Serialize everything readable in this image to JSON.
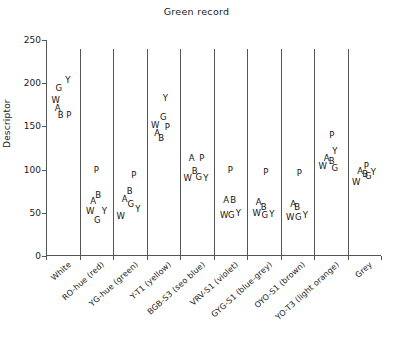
{
  "chart_data": {
    "type": "scatter",
    "title": "Green record",
    "xlabel": "",
    "ylabel": "Descriptor",
    "ylim": [
      0,
      250
    ],
    "yticks": [
      0,
      50,
      100,
      150,
      200,
      250
    ],
    "grid": false,
    "legend": "none",
    "point_label_note": "Each plotted point is drawn as the letter code of its observer",
    "observer_codes": [
      "W",
      "A",
      "B",
      "G",
      "P",
      "Y"
    ],
    "categories": [
      "White",
      "RO-hue (red)",
      "YG-hue (green)",
      "Y-T1 (yellow)",
      "BGB-S3 (seo blue)",
      "VRV-S1 (violet)",
      "GYG-S1 (blue-grey)",
      "OYO-S1 (brown)",
      "YO-T3 (light orange)",
      "Grey"
    ],
    "series": [
      {
        "name": "W",
        "values": [
          180,
          52,
          48,
          152,
          92,
          50,
          52,
          48,
          106,
          88
        ]
      },
      {
        "name": "A",
        "values": [
          173,
          64,
          66,
          143,
          113,
          62,
          60,
          58,
          112,
          97
        ]
      },
      {
        "name": "B",
        "values": [
          163,
          68,
          72,
          137,
          97,
          62,
          57,
          56,
          110,
          95
        ]
      },
      {
        "name": "G",
        "values": [
          195,
          45,
          62,
          161,
          93,
          50,
          50,
          48,
          104,
          94
        ]
      },
      {
        "name": "P",
        "values": [
          163,
          100,
          94,
          150,
          113,
          100,
          97,
          96,
          140,
          104
        ]
      },
      {
        "name": "Y",
        "values": [
          201,
          52,
          56,
          183,
          91,
          51,
          50,
          50,
          121,
          96
        ]
      }
    ],
    "points": [
      {
        "category_index": 0,
        "label": "G",
        "value": 195
      },
      {
        "category_index": 0,
        "label": "Y",
        "value": 201
      },
      {
        "category_index": 0,
        "label": "W",
        "value": 180
      },
      {
        "category_index": 0,
        "label": "A",
        "value": 173
      },
      {
        "category_index": 0,
        "label": "B",
        "value": 163
      },
      {
        "category_index": 0,
        "label": "P",
        "value": 163
      },
      {
        "category_index": 1,
        "label": "P",
        "value": 100
      },
      {
        "category_index": 1,
        "label": "A",
        "value": 64
      },
      {
        "category_index": 1,
        "label": "B",
        "value": 68
      },
      {
        "category_index": 1,
        "label": "W",
        "value": 52
      },
      {
        "category_index": 1,
        "label": "G",
        "value": 45
      },
      {
        "category_index": 1,
        "label": "Y",
        "value": 52
      },
      {
        "category_index": 2,
        "label": "P",
        "value": 94
      },
      {
        "category_index": 2,
        "label": "A",
        "value": 66
      },
      {
        "category_index": 2,
        "label": "B",
        "value": 72
      },
      {
        "category_index": 2,
        "label": "G",
        "value": 62
      },
      {
        "category_index": 2,
        "label": "Y",
        "value": 56
      },
      {
        "category_index": 2,
        "label": "W",
        "value": 48
      },
      {
        "category_index": 3,
        "label": "Y",
        "value": 183
      },
      {
        "category_index": 3,
        "label": "G",
        "value": 161
      },
      {
        "category_index": 3,
        "label": "W",
        "value": 152
      },
      {
        "category_index": 3,
        "label": "P",
        "value": 150
      },
      {
        "category_index": 3,
        "label": "A",
        "value": 143
      },
      {
        "category_index": 3,
        "label": "B",
        "value": 137
      },
      {
        "category_index": 4,
        "label": "A",
        "value": 113
      },
      {
        "category_index": 4,
        "label": "P",
        "value": 113
      },
      {
        "category_index": 4,
        "label": "W",
        "value": 92
      },
      {
        "category_index": 4,
        "label": "B",
        "value": 97
      },
      {
        "category_index": 4,
        "label": "G",
        "value": 93
      },
      {
        "category_index": 4,
        "label": "Y",
        "value": 91
      },
      {
        "category_index": 5,
        "label": "P",
        "value": 100
      },
      {
        "category_index": 5,
        "label": "A",
        "value": 62
      },
      {
        "category_index": 5,
        "label": "B",
        "value": 62
      },
      {
        "category_index": 5,
        "label": "W",
        "value": 50
      },
      {
        "category_index": 5,
        "label": "G",
        "value": 50
      },
      {
        "category_index": 5,
        "label": "Y",
        "value": 51
      },
      {
        "category_index": 6,
        "label": "P",
        "value": 97
      },
      {
        "category_index": 6,
        "label": "A",
        "value": 60
      },
      {
        "category_index": 6,
        "label": "B",
        "value": 57
      },
      {
        "category_index": 6,
        "label": "W",
        "value": 52
      },
      {
        "category_index": 6,
        "label": "G",
        "value": 50
      },
      {
        "category_index": 6,
        "label": "Y",
        "value": 50
      },
      {
        "category_index": 7,
        "label": "P",
        "value": 96
      },
      {
        "category_index": 7,
        "label": "A",
        "value": 58
      },
      {
        "category_index": 7,
        "label": "B",
        "value": 56
      },
      {
        "category_index": 7,
        "label": "W",
        "value": 48
      },
      {
        "category_index": 7,
        "label": "G",
        "value": 48
      },
      {
        "category_index": 7,
        "label": "Y",
        "value": 50
      },
      {
        "category_index": 8,
        "label": "P",
        "value": 140
      },
      {
        "category_index": 8,
        "label": "Y",
        "value": 121
      },
      {
        "category_index": 8,
        "label": "A",
        "value": 112
      },
      {
        "category_index": 8,
        "label": "B",
        "value": 110
      },
      {
        "category_index": 8,
        "label": "W",
        "value": 106
      },
      {
        "category_index": 8,
        "label": "G",
        "value": 104
      },
      {
        "category_index": 9,
        "label": "P",
        "value": 104
      },
      {
        "category_index": 9,
        "label": "A",
        "value": 97
      },
      {
        "category_index": 9,
        "label": "B",
        "value": 95
      },
      {
        "category_index": 9,
        "label": "G",
        "value": 94
      },
      {
        "category_index": 9,
        "label": "Y",
        "value": 96
      },
      {
        "category_index": 9,
        "label": "W",
        "value": 88
      }
    ],
    "point_offsets": [
      {
        "dx": -4,
        "dy": 0
      },
      {
        "dx": 5,
        "dy": -2
      },
      {
        "dx": -7,
        "dy": 0
      },
      {
        "dx": -5,
        "dy": 1
      },
      {
        "dx": -2,
        "dy": 0
      },
      {
        "dx": 6,
        "dy": 0
      },
      {
        "dx": 0,
        "dy": 0
      },
      {
        "dx": -3,
        "dy": 0
      },
      {
        "dx": 2,
        "dy": -2
      },
      {
        "dx": -6,
        "dy": 0
      },
      {
        "dx": 1,
        "dy": 3
      },
      {
        "dx": 8,
        "dy": 0
      },
      {
        "dx": 4,
        "dy": 0
      },
      {
        "dx": -5,
        "dy": 0
      },
      {
        "dx": 0,
        "dy": -3
      },
      {
        "dx": 1,
        "dy": 2
      },
      {
        "dx": 8,
        "dy": 1
      },
      {
        "dx": -9,
        "dy": 1
      },
      {
        "dx": 2,
        "dy": 0
      },
      {
        "dx": 0,
        "dy": 0
      },
      {
        "dx": -8,
        "dy": 0
      },
      {
        "dx": 4,
        "dy": 1
      },
      {
        "dx": -6,
        "dy": 1
      },
      {
        "dx": -2,
        "dy": 0
      },
      {
        "dx": -5,
        "dy": 0
      },
      {
        "dx": 5,
        "dy": 0
      },
      {
        "dx": -9,
        "dy": 1
      },
      {
        "dx": -2,
        "dy": -1
      },
      {
        "dx": 2,
        "dy": 1
      },
      {
        "dx": 9,
        "dy": 1
      },
      {
        "dx": 0,
        "dy": 0
      },
      {
        "dx": -4,
        "dy": -2
      },
      {
        "dx": 3,
        "dy": -2
      },
      {
        "dx": -6,
        "dy": 2
      },
      {
        "dx": 1,
        "dy": 2
      },
      {
        "dx": 8,
        "dy": 1
      },
      {
        "dx": 2,
        "dy": 0
      },
      {
        "dx": -5,
        "dy": -2
      },
      {
        "dx": 0,
        "dy": 0
      },
      {
        "dx": -7,
        "dy": 2
      },
      {
        "dx": 1,
        "dy": 2
      },
      {
        "dx": 8,
        "dy": 1
      },
      {
        "dx": 2,
        "dy": 0
      },
      {
        "dx": -4,
        "dy": -2
      },
      {
        "dx": 0,
        "dy": -1
      },
      {
        "dx": -7,
        "dy": 2
      },
      {
        "dx": 1,
        "dy": 2
      },
      {
        "dx": 8,
        "dy": 2
      },
      {
        "dx": 1,
        "dy": 0
      },
      {
        "dx": 4,
        "dy": 0
      },
      {
        "dx": -4,
        "dy": -1
      },
      {
        "dx": 1,
        "dy": 0
      },
      {
        "dx": -8,
        "dy": 2
      },
      {
        "dx": 4,
        "dy": 2
      },
      {
        "dx": 2,
        "dy": 0
      },
      {
        "dx": -4,
        "dy": -1
      },
      {
        "dx": 1,
        "dy": 0
      },
      {
        "dx": 4,
        "dy": 1
      },
      {
        "dx": 9,
        "dy": -1
      },
      {
        "dx": -8,
        "dy": 2
      }
    ]
  },
  "figure": {
    "title": "Green record",
    "y_axis_title": "Descriptor"
  }
}
